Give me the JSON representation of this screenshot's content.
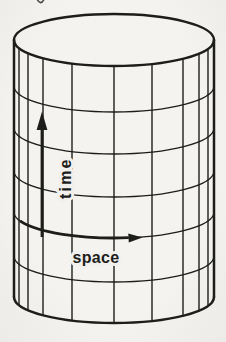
{
  "figure": {
    "labels": {
      "time": "time",
      "space": "space"
    },
    "colors": {
      "paper": "#f1f0ed",
      "ink": "#1d1d1b"
    },
    "cylinder": {
      "cx": 114,
      "rx": 100,
      "ry": 26,
      "top_cy": 40,
      "bottom_cy": 297,
      "meridians_x": [
        19,
        28,
        43,
        72,
        114,
        152,
        183,
        199,
        208
      ],
      "circle_centers_y": [
        86,
        128,
        171,
        212,
        256
      ]
    },
    "arrows": {
      "time": {
        "x": 42,
        "shaft_y1": 237,
        "shaft_y2": 128,
        "head": [
          [
            42,
            111.5
          ],
          [
            36.6,
            130
          ],
          [
            47.4,
            130
          ]
        ]
      },
      "space": {
        "circle_cy": 212,
        "x1": 20,
        "x2": 128.5,
        "head": [
          [
            142.5,
            237.4
          ],
          [
            128.2,
            233.4
          ],
          [
            128.8,
            242.6
          ]
        ]
      }
    },
    "label_anchors": {
      "time": {
        "x": 71,
        "y": 199,
        "rotate": -90
      },
      "space": {
        "x": 96,
        "y": 263
      }
    }
  }
}
